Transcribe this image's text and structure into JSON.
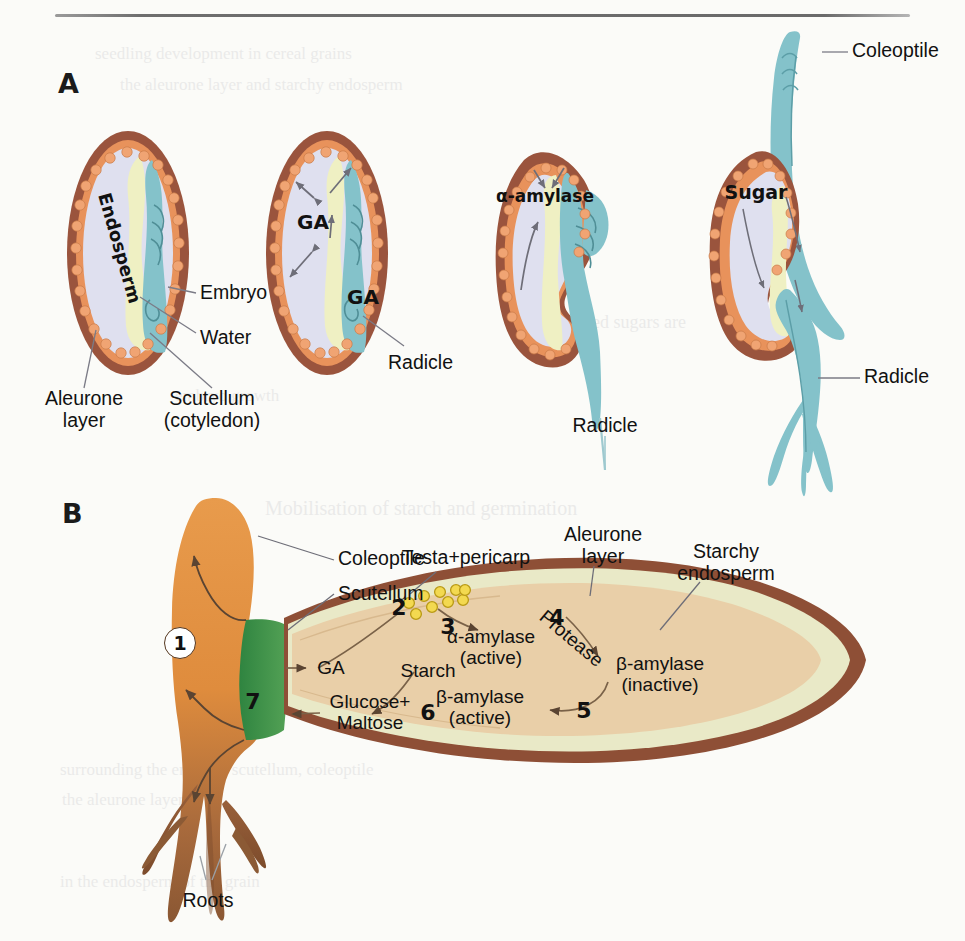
{
  "figure": {
    "panel_a_letter": "A",
    "panel_b_letter": "B"
  },
  "panel_a": {
    "stage1": {
      "internal_labels": [
        {
          "name": "endosperm",
          "text": "Endosperm"
        }
      ],
      "callouts": [
        {
          "name": "embryo",
          "text": "Embryo"
        },
        {
          "name": "water",
          "text": "Water"
        },
        {
          "name": "aleurone-layer",
          "text": "Aleurone\nlayer",
          "line1": "Aleurone",
          "line2": "layer"
        },
        {
          "name": "scutellum",
          "text": "Scutellum (cotyledon)",
          "line1": "Scutellum",
          "line2": "(cotyledon)"
        }
      ]
    },
    "stage2": {
      "internal_labels": [
        {
          "name": "ga-endosperm",
          "text": "GA"
        },
        {
          "name": "ga-embryo",
          "text": "GA"
        }
      ],
      "callouts": [
        {
          "name": "radicle",
          "text": "Radicle"
        }
      ]
    },
    "stage3": {
      "internal_labels": [
        {
          "name": "alpha-amylase",
          "text": "α-amylase"
        }
      ],
      "callouts": [
        {
          "name": "radicle",
          "text": "Radicle"
        }
      ]
    },
    "stage4": {
      "internal_labels": [
        {
          "name": "sugar",
          "text": "Sugar"
        }
      ],
      "callouts": [
        {
          "name": "coleoptile",
          "text": "Coleoptile"
        },
        {
          "name": "radicle",
          "text": "Radicle"
        }
      ]
    }
  },
  "panel_b": {
    "structure_labels": [
      {
        "name": "coleoptile",
        "text": "Coleoptile"
      },
      {
        "name": "scutellum",
        "text": "Scutellum"
      },
      {
        "name": "testa-pericarp",
        "text": "Testa+pericarp"
      },
      {
        "name": "aleurone-layer-line1",
        "text": "Aleurone"
      },
      {
        "name": "aleurone-layer-line2",
        "text": "layer"
      },
      {
        "name": "starchy-endosperm-line1",
        "text": "Starchy"
      },
      {
        "name": "starchy-endosperm-line2",
        "text": "endosperm"
      },
      {
        "name": "roots",
        "text": "Roots"
      }
    ],
    "process_labels": [
      {
        "name": "ga",
        "text": "GA"
      },
      {
        "name": "starch",
        "text": "Starch"
      },
      {
        "name": "alpha-amylase",
        "line1": "α-amylase",
        "line2": "(active)"
      },
      {
        "name": "protease",
        "text": "Protease"
      },
      {
        "name": "beta-amylase-inactive",
        "line1": "β-amylase",
        "line2": "(inactive)"
      },
      {
        "name": "beta-amylase-active",
        "line1": "β-amylase",
        "line2": "(active)"
      },
      {
        "name": "glucose-maltose-line1",
        "text": "Glucose+"
      },
      {
        "name": "glucose-maltose-line2",
        "text": "Maltose"
      }
    ],
    "step_numbers": [
      "1",
      "2",
      "3",
      "4",
      "5",
      "6",
      "7"
    ]
  },
  "colors": {
    "seed_coat_brown": "#98533c",
    "aleurone_orange": "#e8925b",
    "endosperm_lavender": "#dfe0ef",
    "scutellum_yellow": "#eff0c3",
    "embryo_teal": "#84c2ca",
    "panelb_coleoptile_orange": "#e2903f",
    "panelb_root_brown": "#8d5a36",
    "panelb_scutellum_green": "#3f9149",
    "panelb_endosperm_tan": "#e9cfa8",
    "panelb_aleurone_cream": "#e9e9c7",
    "aleurone_granule_yellow": "#f0d53a",
    "arrow_grey": "#6e6e78",
    "rule_grey": "#6e6e6e"
  },
  "ghost_text": [
    {
      "name": "ghost-line-1",
      "text": "seedling development in cereal grains"
    },
    {
      "name": "ghost-line-2",
      "text": "the aleurone layer and starchy endosperm"
    },
    {
      "name": "ghost-line-3",
      "text": "Liberated sugars are"
    },
    {
      "name": "ghost-line-4",
      "text": "embryo  growth"
    },
    {
      "name": "ghost-line-5",
      "text": "Mobilisation of starch and germination"
    },
    {
      "name": "ghost-line-6",
      "text": "surrounding the embryo, scutellum, coleoptile"
    },
    {
      "name": "ghost-line-7",
      "text": "the aleurone layer"
    },
    {
      "name": "ghost-line-8",
      "text": "in the endosperm of the grain"
    }
  ]
}
